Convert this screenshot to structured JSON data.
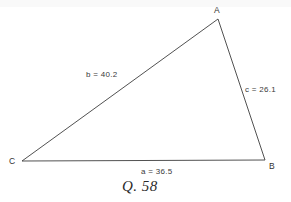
{
  "figure": {
    "width": 291,
    "height": 202,
    "background_color": "#ffffff",
    "line_color": "#3d3d3d",
    "text_color": "#2b2b2b"
  },
  "caption": "Q. 58",
  "vertices": [
    {
      "id": "A",
      "label": "A",
      "x": 218,
      "y": 19
    },
    {
      "id": "B",
      "label": "B",
      "x": 265,
      "y": 160
    },
    {
      "id": "C",
      "label": "C",
      "x": 22,
      "y": 161
    }
  ],
  "sides": [
    {
      "id": "a",
      "label": "a = 36.5",
      "measure": 36.5,
      "from": "C",
      "to": "B"
    },
    {
      "id": "b",
      "label": "b = 40.2",
      "measure": 40.2,
      "from": "C",
      "to": "A"
    },
    {
      "id": "c",
      "label": "c = 26.1",
      "measure": 26.1,
      "from": "A",
      "to": "B"
    }
  ],
  "chart_data": {
    "type": "diagram",
    "title": "Q. 58",
    "shape": "triangle",
    "vertex_labels": [
      "A",
      "B",
      "C"
    ],
    "vertex_points": [
      [
        218,
        19
      ],
      [
        265,
        160
      ],
      [
        22,
        161
      ]
    ],
    "side_labels": [
      "a = 36.5",
      "b = 40.2",
      "c = 26.1"
    ],
    "side_values": [
      36.5,
      40.2,
      26.1
    ],
    "annotations": [
      "A",
      "B",
      "C",
      "a = 36.5",
      "b = 40.2",
      "c = 26.1",
      "Q. 58"
    ],
    "grid": false,
    "legend": "none"
  }
}
